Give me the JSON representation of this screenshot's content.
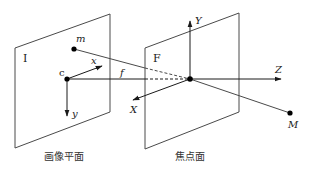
{
  "diagram": {
    "colors": {
      "line": "#4a4a4a",
      "axis": "#1a1a1a",
      "point": "#000000",
      "background": "#ffffff"
    },
    "planes": {
      "image_plane": {
        "label": "I",
        "caption": "画像平面"
      },
      "focal_plane": {
        "label": "F",
        "caption": "焦点面"
      }
    },
    "points": {
      "image_point": "m",
      "principal_point": "c",
      "world_point": "M"
    },
    "image_axes": {
      "x": "x",
      "y": "y"
    },
    "camera_axes": {
      "X": "X",
      "Y": "Y",
      "Z": "Z"
    },
    "focal_length": "f"
  }
}
